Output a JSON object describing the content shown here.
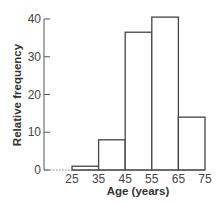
{
  "chart_data": {
    "type": "bar",
    "subtype": "histogram",
    "title": "",
    "xlabel": "Age (years)",
    "ylabel": "Relative frequency",
    "bin_edges": [
      25,
      35,
      45,
      55,
      65,
      75
    ],
    "categories": [
      "25-35",
      "35-45",
      "45-55",
      "55-65",
      "65-75"
    ],
    "values": [
      1,
      8,
      36.5,
      40.5,
      14
    ],
    "xticks": [
      "25",
      "35",
      "45",
      "55",
      "65",
      "75"
    ],
    "yticks": [
      "0",
      "10",
      "20",
      "30",
      "40"
    ],
    "ylim": [
      0,
      40
    ],
    "grid": false,
    "legend": null
  },
  "style": {
    "bar_fill": "#ffffff",
    "bar_stroke": "#444444",
    "axis_color": "#555555"
  }
}
